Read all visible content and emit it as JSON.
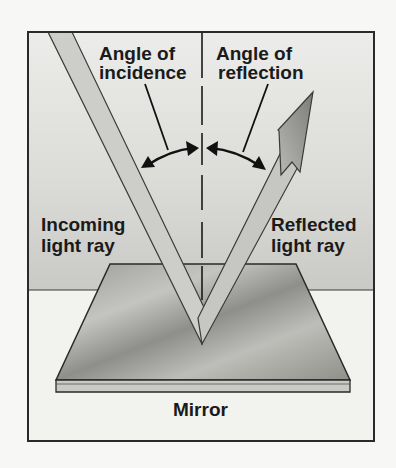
{
  "diagram": {
    "labels": {
      "angle_incidence_line1": "Angle of",
      "angle_incidence_line2": "incidence",
      "angle_reflection_line1": "Angle of",
      "angle_reflection_line2": "reflection",
      "incoming_line1": "Incoming",
      "incoming_line2": "light ray",
      "reflected_line1": "Reflected",
      "reflected_line2": "light ray",
      "mirror": "Mirror"
    },
    "elements": {
      "incident_ray": "incoming light ray striking mirror",
      "reflected_ray": "reflected light ray with arrowhead",
      "normal_line": "dashed normal perpendicular to mirror",
      "angle_arcs": "double-headed arcs marking equal angles"
    },
    "colors": {
      "background_upper": "#d9d9d6",
      "background_lower": "#f2f2ef",
      "ray_fill": "#c8c8c4",
      "arrowhead_fill": "#8a8a86",
      "mirror_fill": "#a9a9a5",
      "outline": "#2a2a2a"
    }
  }
}
